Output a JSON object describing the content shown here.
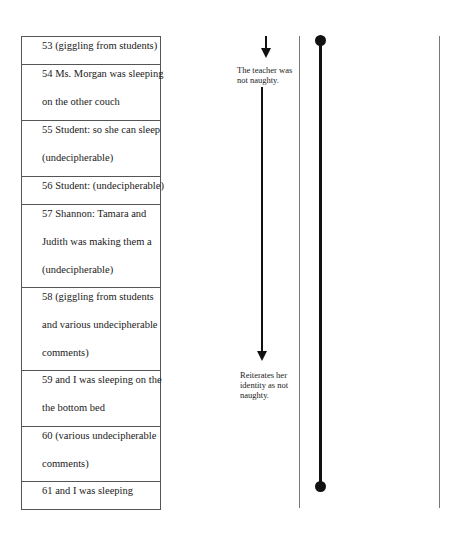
{
  "transcript": {
    "rows": [
      {
        "lines": [
          "53 (giggling from students)"
        ],
        "height": 28
      },
      {
        "lines": [
          "54 Ms. Morgan was sleeping",
          "on the other couch"
        ],
        "height": 56
      },
      {
        "lines": [
          "55 Student:  so she can sleep",
          "(undecipherable)"
        ],
        "height": 56
      },
      {
        "lines": [
          "56 Student: (undecipherable)"
        ],
        "height": 28
      },
      {
        "lines": [
          "57 Shannon: Tamara and",
          "Judith was making them a",
          "(undecipherable)"
        ],
        "height": 83
      },
      {
        "lines": [
          "58 (giggling from students",
          "and various undecipherable",
          "comments)"
        ],
        "height": 83
      },
      {
        "lines": [
          "59  and I was sleeping on the",
          "the bottom bed"
        ],
        "height": 56
      },
      {
        "lines": [
          "60 (various undecipherable",
          "comments)"
        ],
        "height": 55
      },
      {
        "lines": [
          "61 and I was sleeping"
        ],
        "height": 28
      }
    ]
  },
  "annotations": {
    "note1": {
      "line1": "The teacher was",
      "line2": "not naughty."
    },
    "note2": {
      "line1": "Reiterates her",
      "line2": "identity as not",
      "line3": "naughty."
    }
  }
}
